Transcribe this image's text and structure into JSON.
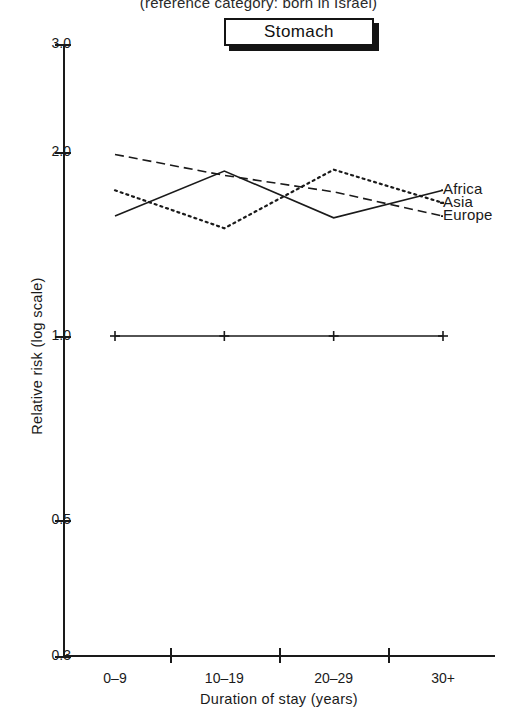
{
  "header": {
    "subtitle": "(reference category: born in Israel)",
    "panel_title": "Stomach"
  },
  "chart_data": {
    "type": "line",
    "title": "Stomach",
    "subtitle": "(reference category: born in Israel)",
    "xlabel": "Duration of stay (years)",
    "ylabel": "Relative risk (log scale)",
    "categories": [
      "0–9",
      "10–19",
      "20–29",
      "30+"
    ],
    "yscale": "log",
    "ylim": [
      0.3,
      3.0
    ],
    "yticks": [
      3.0,
      2.0,
      1.0,
      0.5,
      0.3
    ],
    "ytick_labels": [
      "3.0",
      "2.0",
      "1.0",
      "0.5",
      "0.3"
    ],
    "grid": false,
    "legend_position": "right",
    "reference_line": {
      "name": "Born in Israel (reference)",
      "value": 1.0,
      "style": "solid-with-plus-markers",
      "marker": "+"
    },
    "series": [
      {
        "name": "Africa",
        "style": "solid",
        "values": [
          1.57,
          1.86,
          1.56,
          1.73
        ]
      },
      {
        "name": "Asia",
        "style": "dotted",
        "values": [
          1.73,
          1.5,
          1.87,
          1.65
        ]
      },
      {
        "name": "Europe",
        "style": "dashed",
        "values": [
          1.98,
          1.83,
          1.72,
          1.57
        ]
      }
    ]
  },
  "legend": {
    "items": [
      {
        "label": "Africa"
      },
      {
        "label": "Asia"
      },
      {
        "label": "Europe"
      }
    ]
  },
  "colors": {
    "ink": "#1a1a1a",
    "background": "#ffffff"
  }
}
